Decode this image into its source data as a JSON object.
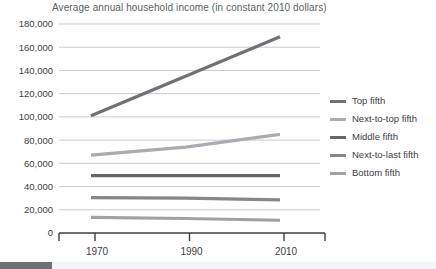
{
  "chart_data": {
    "type": "line",
    "title": "Average annual household income (in constant 2010 dollars)",
    "xlabel": "",
    "ylabel": "",
    "x": [
      1970,
      1990,
      2010
    ],
    "xlim": [
      1967,
      2013
    ],
    "ylim": [
      0,
      180000
    ],
    "ytick_labels": [
      "0",
      "20,000",
      "40,000",
      "60,000",
      "80,000",
      "100,000",
      "120,000",
      "140,000",
      "160,000",
      "180,000"
    ],
    "ytick_values": [
      0,
      20000,
      40000,
      60000,
      80000,
      100000,
      120000,
      140000,
      160000,
      180000
    ],
    "xtick_labels": [
      "1970",
      "1990",
      "2010"
    ],
    "grid": true,
    "legend_position": "right",
    "series": [
      {
        "name": "Top fifth",
        "color": "#6e7276",
        "values": [
          101000,
          135000,
          169000
        ]
      },
      {
        "name": "Next-to-top fifth",
        "color": "#a9adb1",
        "values": [
          67000,
          74000,
          85000
        ]
      },
      {
        "name": "Middle fifth",
        "color": "#63676b",
        "values": [
          49500,
          49500,
          49500
        ]
      },
      {
        "name": "Next-to-last fifth",
        "color": "#84888c",
        "values": [
          30500,
          30000,
          28500
        ]
      },
      {
        "name": "Bottom fifth",
        "color": "#9ea2a6",
        "values": [
          13500,
          12500,
          11000
        ]
      }
    ]
  },
  "legend": {
    "items": [
      {
        "label": "Top fifth"
      },
      {
        "label": "Next-to-top fifth"
      },
      {
        "label": "Middle fifth"
      },
      {
        "label": "Next-to-last fifth"
      },
      {
        "label": "Bottom fifth"
      }
    ]
  },
  "colors": {
    "gridline": "#c9ccce",
    "axis": "#3c4043",
    "title_text": "#5b5f63",
    "tick_text": "#3c4043",
    "bottom_bar": "#6e7174",
    "bottom_strip": "#f4f5f6"
  }
}
